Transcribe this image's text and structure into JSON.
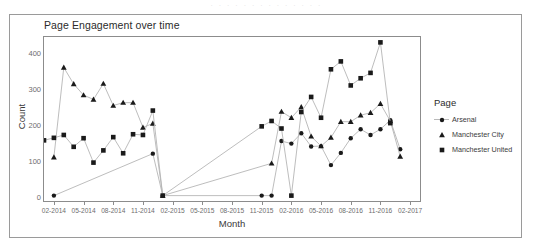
{
  "figure": {
    "title": "Page Engagement over time",
    "scan_artifact": "· · · · · · · · · · · · · ·"
  },
  "legend": {
    "title": "Page",
    "items": [
      {
        "label": "Arsenal",
        "marker": "circle",
        "color": "#1a1a1a"
      },
      {
        "label": "Manchester City",
        "marker": "triangle",
        "color": "#1a1a1a"
      },
      {
        "label": "Manchester United",
        "marker": "square",
        "color": "#1a1a1a"
      }
    ]
  },
  "chart_data": {
    "type": "line",
    "title": "Page Engagement over time",
    "xlabel": "Month",
    "ylabel": "Count",
    "grid": false,
    "legend_position": "right",
    "legend_title": "Page",
    "ylim": [
      -12,
      445
    ],
    "yticks": [
      0,
      100,
      200,
      300,
      400
    ],
    "xticks": [
      "02-2014",
      "05-2014",
      "08-2014",
      "11-2014",
      "02-2015",
      "05-2015",
      "08-2015",
      "11-2015",
      "02-2016",
      "05-2016",
      "08-2016",
      "11-2016",
      "02-2017"
    ],
    "xlim": [
      "01-2014",
      "03-2017"
    ],
    "x_index_range": [
      0,
      38
    ],
    "series": [
      {
        "name": "Arsenal",
        "marker": "circle",
        "color": "#1a1a1a",
        "points": [
          {
            "x": "02-2014",
            "y": 3
          },
          {
            "x": "12-2014",
            "y": 120
          },
          {
            "x": "01-2015",
            "y": 3
          },
          {
            "x": "11-2015",
            "y": 3
          },
          {
            "x": "12-2015",
            "y": 3
          },
          {
            "x": "01-2016",
            "y": 155
          },
          {
            "x": "02-2016",
            "y": 148
          },
          {
            "x": "03-2016",
            "y": 177
          },
          {
            "x": "04-2016",
            "y": 140
          },
          {
            "x": "05-2016",
            "y": 141
          },
          {
            "x": "06-2016",
            "y": 88
          },
          {
            "x": "07-2016",
            "y": 122
          },
          {
            "x": "08-2016",
            "y": 163
          },
          {
            "x": "09-2016",
            "y": 188
          },
          {
            "x": "10-2016",
            "y": 172
          },
          {
            "x": "11-2016",
            "y": 188
          },
          {
            "x": "12-2016",
            "y": 213
          },
          {
            "x": "01-2017",
            "y": 132
          }
        ]
      },
      {
        "name": "Manchester City",
        "marker": "triangle",
        "color": "#1a1a1a",
        "points": [
          {
            "x": "02-2014",
            "y": 110
          },
          {
            "x": "03-2014",
            "y": 360
          },
          {
            "x": "04-2014",
            "y": 314
          },
          {
            "x": "05-2014",
            "y": 283
          },
          {
            "x": "06-2014",
            "y": 271
          },
          {
            "x": "07-2014",
            "y": 315
          },
          {
            "x": "08-2014",
            "y": 254
          },
          {
            "x": "09-2014",
            "y": 262
          },
          {
            "x": "10-2014",
            "y": 262
          },
          {
            "x": "11-2014",
            "y": 193
          },
          {
            "x": "12-2014",
            "y": 204
          },
          {
            "x": "01-2015",
            "y": 3
          },
          {
            "x": "12-2015",
            "y": 93
          },
          {
            "x": "01-2016",
            "y": 237
          },
          {
            "x": "02-2016",
            "y": 220
          },
          {
            "x": "03-2016",
            "y": 250
          },
          {
            "x": "04-2016",
            "y": 168
          },
          {
            "x": "05-2016",
            "y": 141
          },
          {
            "x": "06-2016",
            "y": 165
          },
          {
            "x": "07-2016",
            "y": 209
          },
          {
            "x": "08-2016",
            "y": 209
          },
          {
            "x": "09-2016",
            "y": 227
          },
          {
            "x": "10-2016",
            "y": 234
          },
          {
            "x": "11-2016",
            "y": 259
          },
          {
            "x": "12-2016",
            "y": 211
          },
          {
            "x": "01-2017",
            "y": 112
          }
        ]
      },
      {
        "name": "Manchester United",
        "marker": "square",
        "color": "#1a1a1a",
        "points": [
          {
            "x": "01-2014",
            "y": 157
          },
          {
            "x": "02-2014",
            "y": 164
          },
          {
            "x": "03-2014",
            "y": 172
          },
          {
            "x": "04-2014",
            "y": 139
          },
          {
            "x": "05-2014",
            "y": 163
          },
          {
            "x": "06-2014",
            "y": 95
          },
          {
            "x": "07-2014",
            "y": 129
          },
          {
            "x": "08-2014",
            "y": 166
          },
          {
            "x": "09-2014",
            "y": 121
          },
          {
            "x": "10-2014",
            "y": 174
          },
          {
            "x": "11-2014",
            "y": 172
          },
          {
            "x": "12-2014",
            "y": 240
          },
          {
            "x": "01-2015",
            "y": 3
          },
          {
            "x": "11-2015",
            "y": 196
          },
          {
            "x": "12-2015",
            "y": 211
          },
          {
            "x": "01-2016",
            "y": 190
          },
          {
            "x": "02-2016",
            "y": 3
          },
          {
            "x": "03-2016",
            "y": 236
          },
          {
            "x": "04-2016",
            "y": 278
          },
          {
            "x": "05-2016",
            "y": 220
          },
          {
            "x": "06-2016",
            "y": 355
          },
          {
            "x": "07-2016",
            "y": 377
          },
          {
            "x": "08-2016",
            "y": 310
          },
          {
            "x": "09-2016",
            "y": 330
          },
          {
            "x": "10-2016",
            "y": 345
          },
          {
            "x": "11-2016",
            "y": 430
          },
          {
            "x": "12-2016",
            "y": 205
          }
        ]
      }
    ]
  }
}
